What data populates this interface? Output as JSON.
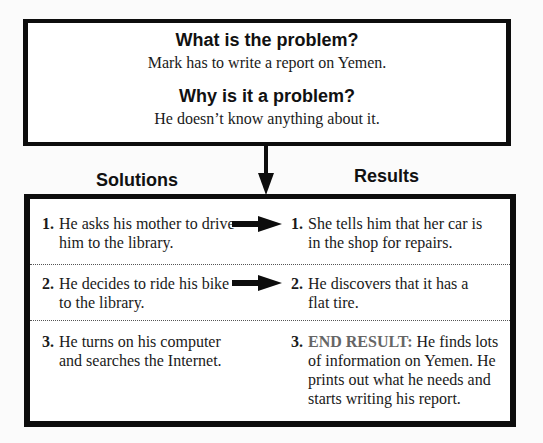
{
  "problem": {
    "question": "What is the problem?",
    "answer": "Mark has to write a report on Yemen.",
    "why_question": "Why is it a problem?",
    "why_answer": "He doesn’t know anything about it."
  },
  "columns": {
    "solutions_label": "Solutions",
    "results_label": "Results"
  },
  "rows": [
    {
      "solution_num": "1.",
      "solution": "He asks his mother to drive him to the library.",
      "result_num": "1.",
      "result": "She tells him that her car is in the shop for repairs.",
      "has_arrow": true
    },
    {
      "solution_num": "2.",
      "solution": "He decides to ride his bike to the library.",
      "result_num": "2.",
      "result": "He discovers that it has a flat tire.",
      "has_arrow": true
    },
    {
      "solution_num": "3.",
      "solution": "He turns on his computer and searches the Internet.",
      "result_num": "3.",
      "result_label": "END RESULT:",
      "result": "He finds lots of information on Yemen. He prints out what he needs and starts writing his report.",
      "has_arrow": false
    }
  ],
  "colors": {
    "border": "#0d0d0d",
    "end_result_label": "#666666",
    "background": "#ffffff"
  }
}
